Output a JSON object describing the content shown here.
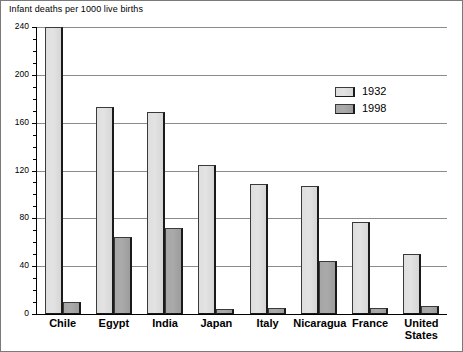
{
  "chart_data": {
    "type": "bar",
    "title": "Infant deaths per 1000 live births",
    "xlabel": "",
    "ylabel": "",
    "ylim": [
      0,
      240
    ],
    "ytick_step": 40,
    "yminor_step": 10,
    "grid": "horizontal",
    "legend_position": "upper-right-inside",
    "categories": [
      "Chile",
      "Egypt",
      "India",
      "Japan",
      "Italy",
      "Nicaragua",
      "France",
      "United States"
    ],
    "ytick_labels": [
      "0",
      "40",
      "80",
      "120",
      "160",
      "200",
      "240"
    ],
    "series": [
      {
        "name": "1932",
        "color": "#dedede",
        "values": [
          240,
          173,
          169,
          125,
          109,
          107,
          77,
          50
        ]
      },
      {
        "name": "1998",
        "color": "#a6a6a6",
        "values": [
          10,
          64,
          72,
          4,
          5,
          44,
          5,
          7
        ]
      }
    ]
  },
  "legend": {
    "entries": [
      {
        "label": "1932"
      },
      {
        "label": "1998"
      }
    ]
  }
}
